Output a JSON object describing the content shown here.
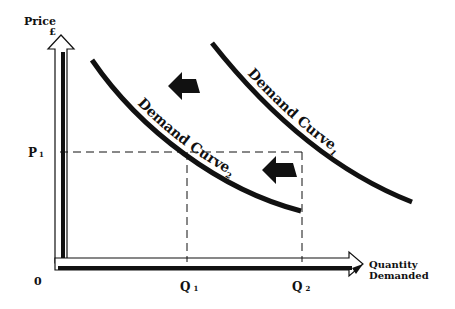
{
  "axes": {
    "y_label": "Price",
    "y_unit": "£",
    "x_label_line1": "Quantity",
    "x_label_line2": "Demanded",
    "origin": "0"
  },
  "markers": {
    "p1": "P",
    "p1_sub": "1",
    "q1": "Q",
    "q1_sub": "1",
    "q2": "Q",
    "q2_sub": "2"
  },
  "curves": [
    {
      "name": "Demand Curve",
      "sub": "1",
      "position": "right/original"
    },
    {
      "name": "Demand Curve",
      "sub": "2",
      "position": "left/shifted"
    }
  ],
  "annotations": {
    "shift_direction": "left",
    "arrow_count": 2
  },
  "colors": {
    "ink": "#111111",
    "background": "#ffffff"
  }
}
